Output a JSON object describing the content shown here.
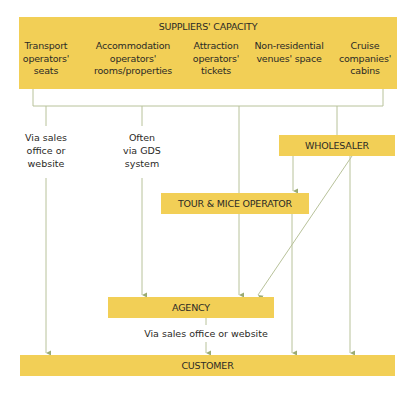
{
  "suppliers": {
    "title": "SUPPLIERS' CAPACITY",
    "columns": [
      {
        "line1": "Transport",
        "line2": "operators'",
        "line3": "seats"
      },
      {
        "line1": "Accommodation",
        "line2": "operators'",
        "line3": "rooms/properties"
      },
      {
        "line1": "Attraction",
        "line2": "operators'",
        "line3": "tickets"
      },
      {
        "line1": "Non-residential",
        "line2": "venues' space",
        "line3": ""
      },
      {
        "line1": "Cruise",
        "line2": "companies'",
        "line3": "cabins"
      }
    ]
  },
  "nodes": {
    "wholesaler": "WHOLESALER",
    "tour_operator": "TOUR & MICE OPERATOR",
    "agency": "AGENCY",
    "customer": "CUSTOMER"
  },
  "annotations": {
    "transport": {
      "line1": "Via sales",
      "line2": "office or",
      "line3": "website"
    },
    "gds": {
      "line1": "Often",
      "line2": "via GDS",
      "line3": "system"
    },
    "agency_to_customer": "Via sales office or website"
  },
  "colors": {
    "box": "#f2cf56",
    "line": "#9aaa74"
  }
}
